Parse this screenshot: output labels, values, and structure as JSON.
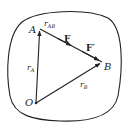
{
  "diagram": {
    "colors": {
      "stroke": "#222222",
      "background": "#ffffff"
    },
    "points": {
      "O": {
        "label": "O",
        "x": 36,
        "y": 103
      },
      "A": {
        "label": "A",
        "x": 40,
        "y": 29
      },
      "B": {
        "label": "B",
        "x": 102,
        "y": 62
      }
    },
    "vectors": {
      "rA": {
        "label": "r",
        "sub": "A",
        "from": "O",
        "to": "A"
      },
      "rB": {
        "label": "r",
        "sub": "B",
        "from": "O",
        "to": "B"
      },
      "rAB": {
        "label": "r",
        "sub": "AB",
        "from": "A",
        "to": "B"
      }
    },
    "forces": {
      "F": {
        "label": "F"
      },
      "Fprime": {
        "label": "F′"
      }
    }
  }
}
